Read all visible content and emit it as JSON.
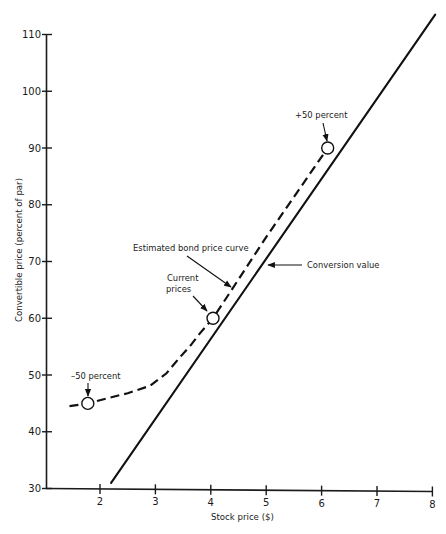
{
  "chart_data": {
    "type": "line",
    "title": "",
    "xlabel": "Stock price ($)",
    "ylabel": "Convertible price (percent of par)",
    "xlim": [
      1,
      8
    ],
    "ylim": [
      30,
      110
    ],
    "xticks": [
      2,
      3,
      4,
      5,
      6,
      7,
      8
    ],
    "yticks": [
      30,
      40,
      50,
      60,
      70,
      80,
      90,
      100,
      110
    ],
    "grid": false,
    "legend": null,
    "series": [
      {
        "name": "Conversion value",
        "style": "solid",
        "points": [
          [
            2.2,
            31.0
          ],
          [
            8.05,
            113.5
          ]
        ]
      },
      {
        "name": "Estimated bond price curve",
        "style": "dashed",
        "points": [
          [
            1.45,
            44.5
          ],
          [
            1.78,
            45.0
          ],
          [
            2.13,
            45.9
          ],
          [
            2.5,
            46.8
          ],
          [
            2.9,
            48.1
          ],
          [
            3.2,
            50.3
          ],
          [
            3.44,
            53.1
          ],
          [
            3.65,
            55.4
          ],
          [
            3.8,
            57.3
          ],
          [
            4.04,
            60.0
          ],
          [
            5.0,
            74.3
          ],
          [
            6.11,
            90.0
          ]
        ]
      }
    ],
    "markers": [
      {
        "label": "–50 percent",
        "x": 1.78,
        "y": 45.0
      },
      {
        "label": "Current prices",
        "label_lines": [
          "Current",
          "prices"
        ],
        "x": 4.04,
        "y": 60.0
      },
      {
        "label": "+50 percent",
        "x": 6.11,
        "y": 90.0
      }
    ],
    "annotations": [
      {
        "text": "Estimated bond price curve",
        "points_to": "Estimated bond price curve"
      },
      {
        "text": "Conversion value",
        "points_to": "Conversion value"
      }
    ]
  }
}
